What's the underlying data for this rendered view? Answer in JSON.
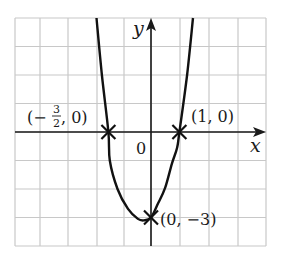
{
  "chart_data": {
    "type": "line",
    "title": "",
    "xlabel": "x",
    "ylabel": "y",
    "origin_label": "0",
    "grid": true,
    "xlim": [
      -5,
      4
    ],
    "ylim": [
      -4,
      4
    ],
    "grid_step": 1,
    "series": [
      {
        "name": "curve",
        "points": [
          [
            -1.92,
            4
          ],
          [
            -1.73,
            2
          ],
          [
            -1.5,
            0
          ],
          [
            -1.45,
            -1
          ],
          [
            -1.18,
            -2
          ],
          [
            -0.81,
            -2.7
          ],
          [
            -0.46,
            -3.05
          ],
          [
            -0.25,
            -3.1
          ],
          [
            0,
            -3
          ],
          [
            0.25,
            -2.5
          ],
          [
            0.5,
            -1.95
          ],
          [
            0.74,
            -1.1
          ],
          [
            0.92,
            -0.55
          ],
          [
            1,
            0
          ],
          [
            1.27,
            2
          ],
          [
            1.48,
            4
          ]
        ]
      }
    ],
    "marked_points": [
      {
        "x": -1.5,
        "y": 0,
        "label_parts": {
          "open": "(−",
          "num": "3",
          "den": "2",
          "close": ", 0)"
        }
      },
      {
        "x": 1,
        "y": 0,
        "label": "(1, 0)"
      },
      {
        "x": 0,
        "y": -3,
        "label": "(0, −3)"
      }
    ]
  },
  "colors": {
    "grid": "#c8c8c8",
    "axis": "#1a1a1a",
    "curve": "#111111"
  }
}
